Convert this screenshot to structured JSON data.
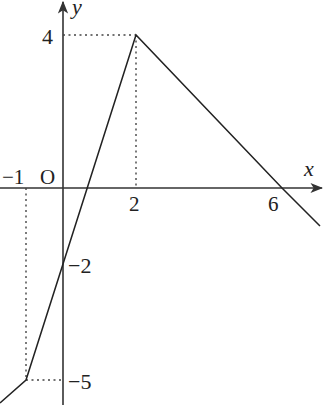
{
  "diagram": {
    "type": "piecewise-linear-function-graph",
    "axes": {
      "x_label": "x",
      "y_label": "y",
      "origin_label": "O"
    },
    "tick_labels": {
      "x": [
        "−1",
        "2",
        "6"
      ],
      "y": [
        "4",
        "−2",
        "−5"
      ]
    },
    "polyline_points": [
      {
        "x": -1.7,
        "y": -5.6
      },
      {
        "x": -1,
        "y": -5
      },
      {
        "x": 2,
        "y": 4
      },
      {
        "x": 6,
        "y": 0
      },
      {
        "x": 7,
        "y": -1
      }
    ],
    "key_points": [
      {
        "x": -1,
        "y": -5
      },
      {
        "x": 0,
        "y": -2
      },
      {
        "x": 2,
        "y": 4
      },
      {
        "x": 6,
        "y": 0
      }
    ],
    "guides": [
      {
        "from": "(0,4)",
        "to": "(2,4)"
      },
      {
        "from": "(2,4)",
        "to": "(2,0)"
      },
      {
        "from": "(-1,0)",
        "to": "(-1,-5)"
      },
      {
        "from": "(-1,-5)",
        "to": "(0,-5)"
      }
    ],
    "colors": {
      "line": "#222222",
      "axes": "#333333",
      "guides": "#444444"
    }
  }
}
